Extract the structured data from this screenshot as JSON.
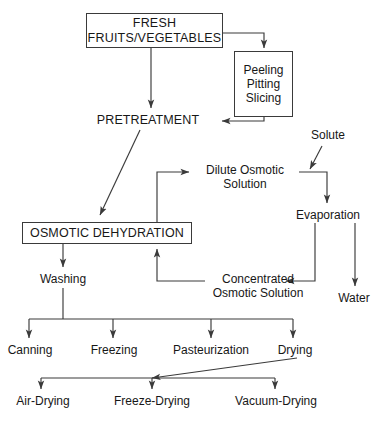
{
  "diagram": {
    "line_color": "#3a3a3a",
    "text_color": "#171717",
    "background": "#ffffff",
    "nodes": {
      "fresh": "FRESH\nFRUITS/VEGETABLES",
      "peeling": "Peeling\nPitting\nSlicing",
      "pretreatment": "PRETREATMENT",
      "solute": "Solute",
      "dilute_osmotic_solution": "Dilute Osmotic\nSolution",
      "evaporation": "Evaporation",
      "osmotic_dehydration": "OSMOTIC DEHYDRATION",
      "concentrated_osmotic_solution": "Concentrated\nOsmotic Solution",
      "water": "Water",
      "washing": "Washing",
      "canning": "Canning",
      "freezing": "Freezing",
      "pasteurization": "Pasteurization",
      "drying": "Drying",
      "air_drying": "Air-Drying",
      "freeze_drying": "Freeze-Drying",
      "vacuum_drying": "Vacuum-Drying"
    },
    "edges": [
      {
        "from": "fresh",
        "to": "peeling"
      },
      {
        "from": "fresh",
        "to": "pretreatment"
      },
      {
        "from": "peeling",
        "to": "pretreatment"
      },
      {
        "from": "pretreatment",
        "to": "osmotic_dehydration"
      },
      {
        "from": "osmotic_dehydration",
        "to": "dilute_osmotic_solution"
      },
      {
        "from": "solute",
        "to": "evaporation"
      },
      {
        "from": "dilute_osmotic_solution",
        "to": "evaporation"
      },
      {
        "from": "evaporation",
        "to": "concentrated_osmotic_solution"
      },
      {
        "from": "evaporation",
        "to": "water"
      },
      {
        "from": "concentrated_osmotic_solution",
        "to": "osmotic_dehydration"
      },
      {
        "from": "osmotic_dehydration",
        "to": "washing"
      },
      {
        "from": "washing",
        "to": "canning"
      },
      {
        "from": "washing",
        "to": "freezing"
      },
      {
        "from": "washing",
        "to": "pasteurization"
      },
      {
        "from": "washing",
        "to": "drying"
      },
      {
        "from": "drying",
        "to": "air_drying"
      },
      {
        "from": "drying",
        "to": "freeze_drying"
      },
      {
        "from": "drying",
        "to": "vacuum_drying"
      }
    ]
  }
}
